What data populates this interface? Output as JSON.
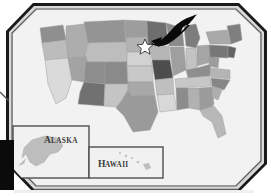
{
  "graphic": {
    "kind": "framed-map-illustration",
    "title": "United States Map",
    "background_color": "#ffffff",
    "frame": {
      "name": "beveled-photo-frame",
      "outer_border_color": "#1c1c1c",
      "inner_border_color": "#6e6e6e",
      "fill_color": "#f2f2f2",
      "corner_style": "chamfered"
    },
    "occluder": {
      "name": "black-block",
      "color": "#0b0b0b",
      "x": 0,
      "y": 140,
      "width": 14,
      "height": 50
    }
  },
  "map": {
    "name": "us-choropleth",
    "region": "United States",
    "palette": {
      "lightest": "#dcdcdc",
      "light": "#cfcfcf",
      "mid_light": "#c0c0c0",
      "mid": "#ababab",
      "mid_dark": "#969696",
      "dark": "#808080",
      "darker": "#6b6b6b",
      "darkest": "#4a4a4a",
      "outline": "#9a9a9a",
      "water": "#f2f2f2"
    }
  },
  "marker": {
    "name": "star-marker",
    "shape": "five-point-star",
    "fill": "#ffffff",
    "stroke": "#2e2e2e",
    "x": 145,
    "y": 46,
    "size": 13,
    "label": "",
    "points_to": "Wisconsin"
  },
  "pointer": {
    "name": "curved-arrow",
    "fill": "#0a0a0a",
    "direction": "down-left",
    "tip_x": 152,
    "tip_y": 44
  },
  "insets": [
    {
      "id": "alaska",
      "label": "ALASKA",
      "label_initial": "A",
      "label_rest": "LASKA",
      "box": {
        "x": 13,
        "y": 126,
        "width": 76,
        "height": 52
      },
      "land_fill": "#bdbdbd",
      "border_color": "#4f4f4f",
      "fill_color": "#f1f1f1"
    },
    {
      "id": "hawaii",
      "label": "HAWAII",
      "label_initial": "H",
      "label_rest": "AWAII",
      "box": {
        "x": 89,
        "y": 147,
        "width": 74,
        "height": 31
      },
      "land_fill": "#bdbdbd",
      "border_color": "#4f4f4f",
      "fill_color": "#f1f1f1"
    }
  ]
}
